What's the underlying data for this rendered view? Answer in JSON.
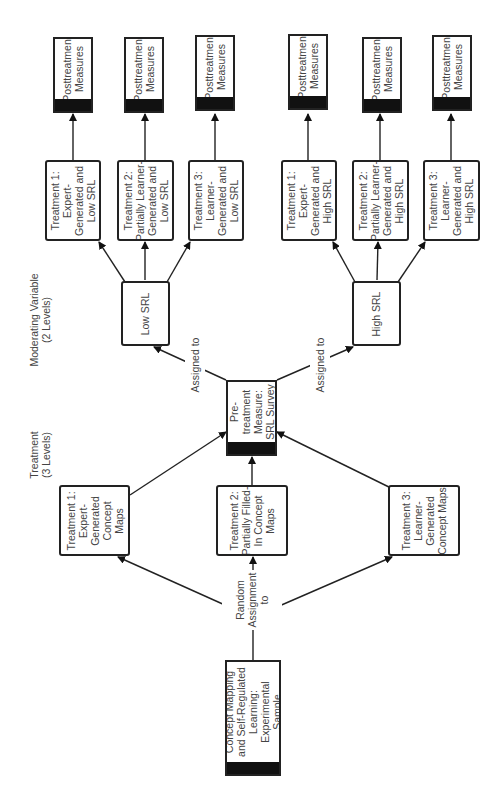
{
  "labels": {
    "treatment_heading": "Treatment\n(3 Levels)",
    "moderator_heading": "Moderating Variable\n(2 Levels)",
    "random_assignment": "Random\nAssignment\nto",
    "assigned_to_low": "Assigned to",
    "assigned_to_high": "Assigned to"
  },
  "sample": "Concept Mapping\nand Self-Regulated\nLearning:\nExperimental\nSample",
  "treatments": [
    "Treatment 1:\nExpert-\nGenerated\nConcept\nMaps",
    "Treatment 2:\nPartially Filled-\nIn Concept\nMaps",
    "Treatment 3:\nLearner-\nGenerated\nConcept Maps"
  ],
  "pretreatment": "Pre-\ntreatment\nMeasure:\nSRL Survey",
  "moderator_levels": [
    "Low SRL",
    "High SRL"
  ],
  "cells_low": [
    "Treatment 1:\nExpert-\nGenerated and\nLow SRL",
    "Treatment 2:\nPartially Learner-\nGenerated and\nLow SRL",
    "Treatment 3:\nLearner-\nGenerated and\nLow SRL"
  ],
  "cells_high": [
    "Treatment 1:\nExpert-\nGenerated and\nHigh SRL",
    "Treatment 2:\nPartially Learner-\nGenerated and\nHigh SRL",
    "Treatment 3:\nLearner-\nGenerated and\nHigh SRL"
  ],
  "posttreatment": [
    "Posttreatment\nMeasures",
    "Posttreatment\nMeasures",
    "Posttreatment\nMeasures",
    "Posttreatment\nMeasures",
    "Posttreatment\nMeasures",
    "Posttreatment\nMeasures"
  ]
}
